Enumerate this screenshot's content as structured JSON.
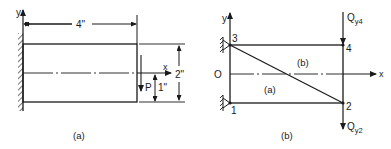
{
  "figure_a": {
    "caption": "(a)",
    "dimension_length": "4\"",
    "dimension_height": "2\"",
    "dimension_offset": "1\"",
    "load_label": "P",
    "axis_x": "x",
    "axis_y": "y"
  },
  "figure_b": {
    "caption": "(b)",
    "axis_x": "x",
    "axis_y": "y",
    "origin": "O",
    "nodes": [
      {
        "id": "1",
        "label": "1"
      },
      {
        "id": "2",
        "label": "2"
      },
      {
        "id": "3",
        "label": "3"
      },
      {
        "id": "4",
        "label": "4"
      }
    ],
    "elements": [
      {
        "id": "a",
        "label": "(a)"
      },
      {
        "id": "b",
        "label": "(b)"
      }
    ],
    "forces": {
      "q_top": {
        "main": "Q",
        "sub": "y4"
      },
      "q_bottom": {
        "main": "Q",
        "sub": "y2"
      }
    }
  },
  "colors": {
    "ink": "#1a1a1a",
    "background": "#ffffff"
  }
}
